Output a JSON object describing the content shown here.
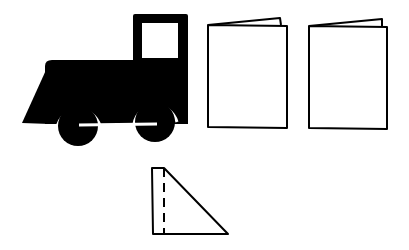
{
  "figure": {
    "colors": {
      "ink": "#000000",
      "paper": "#ffffff"
    },
    "items": [
      {
        "name": "train-engine",
        "kind": "silhouette"
      },
      {
        "name": "folded-card-1",
        "kind": "outline"
      },
      {
        "name": "folded-card-2",
        "kind": "outline"
      },
      {
        "name": "folded-triangle",
        "kind": "outline-with-dashed-fold"
      }
    ]
  }
}
